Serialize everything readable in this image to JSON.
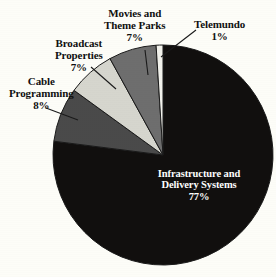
{
  "chart_data": {
    "type": "pie",
    "title": "",
    "subtitle": "",
    "xlabel": "",
    "ylabel": "",
    "legend_position": "none",
    "grid": false,
    "units": "percent",
    "categories": [
      "Telemundo",
      "Movies and Theme Parks",
      "Broadcast Properties",
      "Cable Programming",
      "Infrastructure and Delivery Systems"
    ],
    "values": [
      1,
      7,
      7,
      8,
      77
    ],
    "slices": [
      {
        "name": "Telemundo",
        "label_line_1": "Telemundo",
        "label_line_2": "",
        "percent_text": "1%",
        "value": 1,
        "color": "#f2f2ec",
        "label_color": "#101010",
        "start_deg": 0,
        "end_deg": 3.6
      },
      {
        "name": "Movies and Theme Parks",
        "label_line_1": "Movies and",
        "label_line_2": "Theme Parks",
        "percent_text": "7%",
        "value": 7,
        "color": "#6e6e6e",
        "label_color": "#101010",
        "start_deg": 3.6,
        "end_deg": 28.8
      },
      {
        "name": "Broadcast Properties",
        "label_line_1": "Broadcast",
        "label_line_2": "Properties",
        "percent_text": "7%",
        "value": 7,
        "color": "#d6d6ce",
        "label_color": "#101010",
        "start_deg": 28.8,
        "end_deg": 54.0
      },
      {
        "name": "Cable Programming",
        "label_line_1": "Cable",
        "label_line_2": "Programming",
        "percent_text": "8%",
        "value": 8,
        "color": "#4a4a4a",
        "label_color": "#101010",
        "start_deg": 54.0,
        "end_deg": 82.8
      },
      {
        "name": "Infrastructure and Delivery Systems",
        "label_line_1": "Infrastructure and",
        "label_line_2": "Delivery Systems",
        "percent_text": "77%",
        "value": 77,
        "color": "#110f0e",
        "label_color": "#ffffff",
        "start_deg": 82.8,
        "end_deg": 360.0
      }
    ],
    "colors": {
      "background": "#fdfdf8",
      "outline": "#1a1a1a",
      "leader_line": "#1a1a1a",
      "telemundo": "#f2f2ec",
      "movies": "#6e6e6e",
      "broadcast": "#d6d6ce",
      "cable": "#4a4a4a",
      "infrastructure": "#110f0e"
    },
    "geometry": {
      "center_x": 163,
      "center_y": 155,
      "radius": 110,
      "direction": "counterclockwise",
      "start_angle": "12 o'clock"
    }
  }
}
